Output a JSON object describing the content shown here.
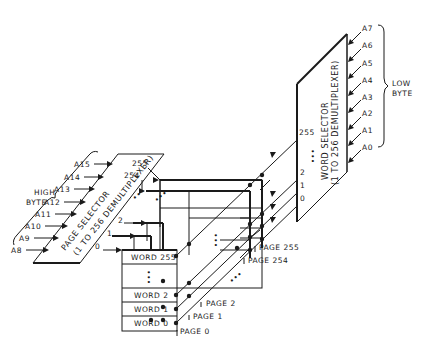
{
  "diagram": {
    "word_selector": {
      "title": "WORD SELECTOR",
      "subtitle": "(1 TO 256 DEMULTIPLEXER)",
      "outputs": [
        "255",
        "2",
        "1",
        "0"
      ]
    },
    "page_selector": {
      "title": "PAGE SELECTOR",
      "subtitle": "(1 TO 256 DEMULTIPLEXER)",
      "outputs": [
        "255",
        "254",
        "2",
        "1",
        "0"
      ]
    },
    "low_byte": {
      "label_line1": "LOW",
      "label_line2": "BYTE",
      "inputs": [
        "A7",
        "A6",
        "A5",
        "A4",
        "A3",
        "A2",
        "A1",
        "A0"
      ]
    },
    "high_byte": {
      "label_line1": "HIGH",
      "label_line2": "BYTE",
      "inputs": [
        "A15",
        "A14",
        "A13",
        "A12",
        "A11",
        "A10",
        "A9",
        "A8"
      ]
    },
    "page0_words": [
      "WORD 255",
      "WORD 2",
      "WORD 1",
      "WORD 0"
    ],
    "pages": [
      "PAGE 255",
      "PAGE 254",
      "PAGE 2",
      "PAGE 1",
      "PAGE 0"
    ],
    "ellipsis": "•••"
  }
}
